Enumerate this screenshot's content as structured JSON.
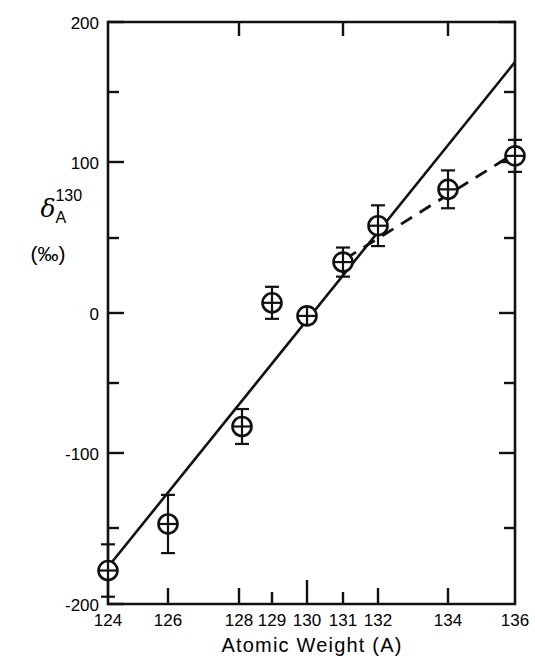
{
  "figure": {
    "background_color": "#ffffff",
    "ink_color": "#111111"
  },
  "axes": {
    "y_label_symbol": "δ",
    "y_label_superscript": "130",
    "y_label_subscript": "A",
    "y_label_unit": "(‰)",
    "x_label": "Atomic Weight (A)",
    "y_ticks_major": [
      "200",
      "100",
      "0",
      "-100",
      "-200"
    ],
    "y_tick_values": [
      200,
      100,
      0,
      -100,
      -200
    ],
    "y_minor_tick_values": [
      150,
      50,
      -50,
      -150
    ],
    "x_ticks": [
      "124",
      "126",
      "128",
      "129",
      "130",
      "131",
      "132",
      "134",
      "136"
    ],
    "x_tick_values": [
      124,
      126,
      128,
      129,
      130,
      131,
      132,
      134,
      136
    ],
    "ylim": [
      -200,
      200
    ],
    "grid": "off",
    "legend": "none"
  },
  "chart_data": {
    "type": "scatter",
    "title": "",
    "xlabel": "Atomic Weight (A)",
    "ylabel": "δ130A (‰)",
    "ylim": [
      -200,
      200
    ],
    "categories": [
      124,
      126,
      128,
      129,
      130,
      131,
      132,
      134,
      136
    ],
    "series": [
      {
        "name": "measured isotopic anomaly",
        "marker": "circle-with-cross",
        "values": [
          -177,
          -145,
          -78,
          7,
          -2,
          35,
          60,
          85,
          108
        ],
        "yerr": [
          18,
          20,
          12,
          11,
          5,
          10,
          14,
          13,
          11
        ]
      }
    ],
    "lines": [
      {
        "name": "solid-fit-line",
        "style": "solid",
        "x": [
          124,
          136
        ],
        "y": [
          -180,
          178
        ]
      },
      {
        "name": "dashed-fit-line",
        "style": "dashed",
        "x": [
          131,
          136
        ],
        "y": [
          38,
          108
        ]
      }
    ],
    "annotations": []
  }
}
